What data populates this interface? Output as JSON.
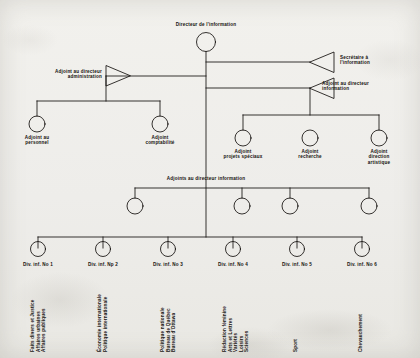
{
  "document": {
    "title": "Directeur de l'information",
    "language": "fr",
    "kind": "organizational-chart"
  },
  "root": {
    "label": "Directeur de l'information"
  },
  "staff": {
    "admin": {
      "label": "Adjoint au directeur\nadministration"
    },
    "secretary": {
      "label": "Secrétaire à\nl'information"
    },
    "assistant_director": {
      "label": "Adjoint au directeur\ninformation"
    }
  },
  "admin_children": [
    {
      "label": "Adjoint au\npersonnel"
    },
    {
      "label": "Adjoint\ncomptabilité"
    }
  ],
  "assistant_children": [
    {
      "label": "Adjoint\nprojets spéciaux"
    },
    {
      "label": "Adjoint\nrecherche"
    },
    {
      "label": "Adjoint\ndirection\nartistique"
    }
  ],
  "assistants_row": {
    "label": "Adjoints au directeur information",
    "nodes": [
      {
        "label": ""
      },
      {
        "label": ""
      },
      {
        "label": ""
      },
      {
        "label": ""
      }
    ]
  },
  "divisions": [
    {
      "title": "Div. inf. No 1",
      "detail": "Faits divers et Justice\nAffaires urbaines\nAffaires publiques"
    },
    {
      "title": "Div. inf. Np 2",
      "detail": "Économie internationale\nPolitique internationale"
    },
    {
      "title": "Div. inf. No 3",
      "detail": "Politique nationale\nBureau de Québec\nBureau d'Ottawa"
    },
    {
      "title": "Div. inf. No 4",
      "detail": "Rédaction féminine\nArts et Lettres\nVariétés\nLoisirs\nSciences"
    },
    {
      "title": "Div. inf. No 5",
      "detail": "Sport"
    },
    {
      "title": "Div. inf. No 6",
      "detail": "Chevauchement"
    }
  ],
  "colors": {
    "ink": "#14110e",
    "paper": "#efeeea"
  }
}
